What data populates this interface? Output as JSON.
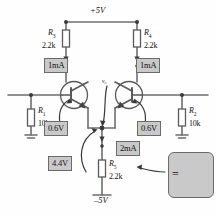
{
  "diagram": {
    "colors": {
      "wire": "#6e6e6e",
      "component_outline": "#5a5a5a",
      "label_fill": "#c9c9c9",
      "label_border": "#6b6b6b",
      "text": "#111111",
      "background": "#ffffff"
    },
    "rails": {
      "positive": "+5V",
      "negative": "–5V"
    },
    "node_labels": [
      {
        "name": "tail-node-label",
        "text": "v₀"
      }
    ],
    "resistors": [
      {
        "id": "R1",
        "name": "resistor-r1",
        "ref": "R",
        "sub": "1",
        "value": "10k",
        "orientation": "vertical"
      },
      {
        "id": "R2",
        "name": "resistor-r2",
        "ref": "R",
        "sub": "2",
        "value": "10k",
        "orientation": "vertical"
      },
      {
        "id": "R3",
        "name": "resistor-r3",
        "ref": "R",
        "sub": "3",
        "value": "2.2k",
        "orientation": "vertical"
      },
      {
        "id": "R4",
        "name": "resistor-r4",
        "ref": "R",
        "sub": "4",
        "value": "2.2k",
        "orientation": "vertical"
      },
      {
        "id": "R5",
        "name": "resistor-r5",
        "ref": "R",
        "sub": "5",
        "value": "2.2k",
        "orientation": "vertical"
      }
    ],
    "transistors": [
      {
        "id": "Q1",
        "name": "transistor-q1-npn",
        "type": "npn",
        "side": "left"
      },
      {
        "id": "Q2",
        "name": "transistor-q2-npn",
        "type": "npn",
        "side": "right"
      }
    ],
    "annotations": [
      {
        "id": "ic-left",
        "name": "annotation-collector-current-left",
        "text": "1mA"
      },
      {
        "id": "ic-right",
        "name": "annotation-collector-current-right",
        "text": "1mA"
      },
      {
        "id": "vbe-left",
        "name": "annotation-vbe-left",
        "text": "0.6V"
      },
      {
        "id": "vbe-right",
        "name": "annotation-vbe-right",
        "text": "0.6V"
      },
      {
        "id": "itail",
        "name": "annotation-tail-current",
        "text": "2mA"
      },
      {
        "id": "vtail",
        "name": "annotation-tail-voltage",
        "text": "4.4V"
      }
    ],
    "equivalence_note": {
      "name": "current-source-equivalence-box",
      "equals_sign": "=",
      "symbol": "current-source-symbol"
    },
    "ground_symbols": [
      {
        "name": "ground-symbol-left"
      },
      {
        "name": "ground-symbol-right"
      }
    ]
  }
}
